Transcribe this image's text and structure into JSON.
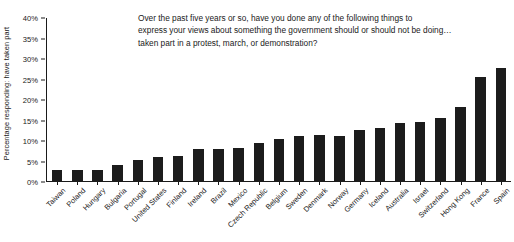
{
  "chart_data": {
    "type": "bar",
    "title_lines": [
      "Over the past five years or so, have you done any of the following things to",
      "express your views about something the government should or should not be doing…",
      "taken part in a protest, march, or demonstration?"
    ],
    "xlabel": "",
    "ylabel": "Percentage responding: have taken part",
    "ylim": [
      0,
      40
    ],
    "ytick_step": 5,
    "ytick_labels": [
      "0%",
      "5%",
      "10%",
      "15%",
      "20%",
      "25%",
      "30%",
      "35%",
      "40%"
    ],
    "ytick_values": [
      0,
      5,
      10,
      15,
      20,
      25,
      30,
      35,
      40
    ],
    "grid": false,
    "legend": false,
    "bar_color": "#1c1c1c",
    "axis_color": "#1a1a1a",
    "categories": [
      "Taiwan",
      "Poland",
      "Hungary",
      "Bulgaria",
      "Portugal",
      "United States",
      "Finland",
      "Ireland",
      "Brazil",
      "Mexico",
      "Czech Republic",
      "Belgium",
      "Sweden",
      "Denmark",
      "Norway",
      "Germany",
      "Iceland",
      "Australia",
      "Israel",
      "Switzerland",
      "Hong Kong",
      "France",
      "Spain"
    ],
    "values": [
      3.0,
      3.0,
      3.0,
      4.1,
      5.3,
      6.2,
      6.3,
      8.1,
      8.1,
      8.2,
      9.4,
      10.4,
      11.2,
      11.4,
      11.3,
      12.7,
      13.2,
      14.5,
      14.6,
      15.5,
      18.3,
      25.5,
      27.8
    ]
  }
}
